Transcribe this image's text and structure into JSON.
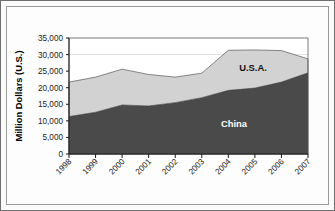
{
  "chart_data": {
    "type": "area",
    "stacked": true,
    "title": "",
    "xlabel": "",
    "ylabel": "Million Dollars (U.S.)",
    "categories": [
      "1998",
      "1999",
      "2000",
      "2001",
      "2002",
      "2003",
      "2004",
      "2005",
      "2006",
      "2007"
    ],
    "series": [
      {
        "name": "China",
        "color": "#4a4a4a",
        "label": "China",
        "values": [
          11300,
          12600,
          14800,
          14500,
          15500,
          17000,
          19200,
          19900,
          21700,
          24500
        ]
      },
      {
        "name": "U.S.A.",
        "color": "#d2d2d2",
        "label": "U.S.A.",
        "values": [
          10400,
          10600,
          10800,
          9500,
          7700,
          7400,
          12100,
          11500,
          9500,
          4200
        ]
      }
    ],
    "totals": [
      21700,
      23200,
      25600,
      24000,
      23200,
      24400,
      31300,
      31400,
      31200,
      28700
    ],
    "ylim": [
      0,
      35000
    ],
    "yticks": [
      0,
      5000,
      10000,
      15000,
      20000,
      25000,
      30000,
      35000
    ],
    "ytick_labels": [
      "0",
      "5,000",
      "10,000",
      "15,000",
      "20,000",
      "25,000",
      "30,000",
      "35,000"
    ],
    "gridlines": [
      30000
    ],
    "grid": "horizontal-faint",
    "legend_position": "inline-annotations",
    "annotations": [
      {
        "text": "U.S.A.",
        "series": "U.S.A.",
        "near_category": "2005"
      },
      {
        "text": "China",
        "series": "China",
        "near_category": "2004"
      }
    ]
  },
  "figure": {
    "background_color": "#fdfdfd",
    "border_color": "#9a9a9a",
    "axis_color": "#1a1a1a"
  }
}
